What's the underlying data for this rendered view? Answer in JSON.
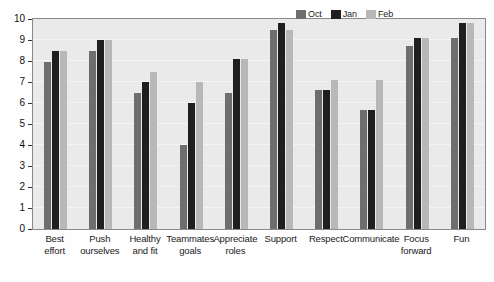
{
  "chart_data": {
    "type": "bar",
    "title": "",
    "subtitle": "",
    "xlabel": "",
    "ylabel": "",
    "ylim": [
      0,
      10
    ],
    "y_ticks": [
      0,
      1,
      2,
      3,
      4,
      5,
      6,
      7,
      8,
      9,
      10
    ],
    "grid": true,
    "legend_position": "top-right",
    "orientation": "vertical",
    "grouping": "grouped",
    "categories": [
      "Best effort",
      "Push ourselves",
      "Healthy and fit",
      "Teammates goals",
      "Appreciate roles",
      "Support",
      "Respect",
      "Communicate",
      "Focus forward",
      "Fun"
    ],
    "category_lines": [
      [
        "Best",
        "effort"
      ],
      [
        "Push",
        "ourselves"
      ],
      [
        "Healthy",
        "and fit"
      ],
      [
        "Teammates",
        "goals"
      ],
      [
        "Appreciate",
        "roles"
      ],
      [
        "Support",
        ""
      ],
      [
        "Respect",
        ""
      ],
      [
        "Communicate",
        ""
      ],
      [
        "Focus",
        "forward"
      ],
      [
        "Fun",
        ""
      ]
    ],
    "series": [
      {
        "name": "Oct",
        "color": "#6e6e6e",
        "values": [
          7.95,
          8.5,
          6.5,
          4.0,
          6.5,
          9.5,
          6.6,
          5.65,
          8.7,
          9.1
        ]
      },
      {
        "name": "Jan",
        "color": "#1f1f1f",
        "values": [
          8.5,
          9.0,
          7.0,
          6.0,
          8.1,
          9.8,
          6.6,
          5.65,
          9.1,
          9.8
        ]
      },
      {
        "name": "Feb",
        "color": "#b8b8b8",
        "values": [
          8.5,
          9.0,
          7.5,
          7.0,
          8.1,
          9.5,
          7.1,
          7.1,
          9.1,
          9.8
        ]
      }
    ]
  },
  "legend": {
    "entries": [
      {
        "label": "Oct",
        "color": "#6e6e6e"
      },
      {
        "label": "Jan",
        "color": "#1f1f1f"
      },
      {
        "label": "Feb",
        "color": "#b8b8b8"
      }
    ]
  },
  "colors": {
    "plot_background": "#eaeaea",
    "gridline": "#f4f4f4",
    "axis": "#8a8a8a",
    "text": "#1b1b1b",
    "oct": "#6e6e6e",
    "jan": "#1f1f1f",
    "feb": "#b8b8b8"
  }
}
